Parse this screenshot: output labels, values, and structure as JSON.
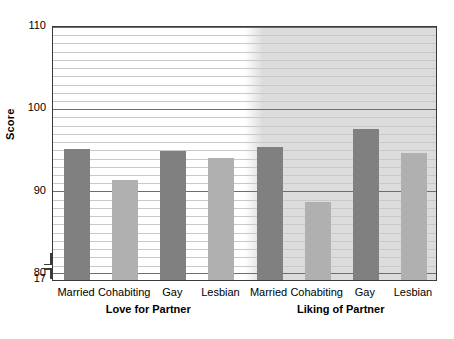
{
  "chart_data": {
    "type": "bar",
    "title": "",
    "xlabel": "",
    "ylabel": "Score",
    "ylim": [
      79,
      110
    ],
    "axis_break_value": "17",
    "grid": true,
    "legend_position": "none",
    "y_ticks": [
      "110",
      "100",
      "90",
      "80",
      "17"
    ],
    "y_tick_values": [
      110,
      100,
      90,
      80,
      17
    ],
    "major_gridlines": [
      110,
      100,
      90,
      80
    ],
    "minor_gridline_step": 1,
    "groups": [
      {
        "name": "Love for Partner",
        "shaded": false,
        "categories": [
          "Married",
          "Cohabiting",
          "Gay",
          "Lesbian"
        ],
        "values": [
          94.9,
          91.1,
          94.7,
          93.8
        ],
        "bar_shades": [
          "dark",
          "light",
          "dark",
          "light"
        ]
      },
      {
        "name": "Liking of Partner",
        "shaded": true,
        "categories": [
          "Married",
          "Cohabiting",
          "Gay",
          "Lesbian"
        ],
        "values": [
          95.2,
          88.5,
          97.3,
          94.5
        ],
        "bar_shades": [
          "dark",
          "light",
          "dark",
          "light"
        ]
      }
    ],
    "colors": {
      "bar_dark": "#808080",
      "bar_light": "#b0b0b0",
      "panel_shade": "#dcdcdc",
      "gridline_minor": "#c9c9c9",
      "gridline_major": "#6e6e6e",
      "frame": "#3a3a3a",
      "background": "#ffffff"
    }
  }
}
